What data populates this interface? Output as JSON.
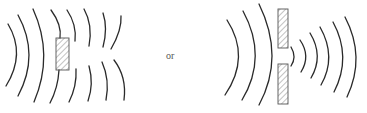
{
  "figure": {
    "separator_label": "or",
    "colors": {
      "wave": "#2a2a2a",
      "barrier_stroke": "#555555",
      "hatch": "#777777",
      "background": "#ffffff"
    },
    "left_panel": {
      "name": "obstacle-diffraction",
      "obstacle": {
        "x": 56,
        "y": 38,
        "w": 13,
        "h": 32
      },
      "incoming_wavefronts": 4,
      "outgoing_wavefronts_per_side": 4
    },
    "right_panel": {
      "name": "slit-diffraction",
      "barriers": [
        {
          "x": 278,
          "y": 9,
          "w": 10,
          "h": 39
        },
        {
          "x": 278,
          "y": 64,
          "w": 10,
          "h": 40
        }
      ],
      "incoming_wavefronts": 3,
      "outgoing_wavefronts": 6
    }
  }
}
